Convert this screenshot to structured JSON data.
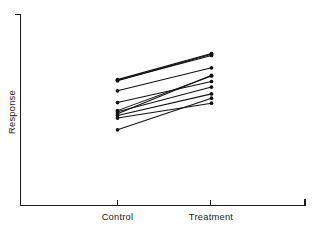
{
  "chart_data": {
    "type": "line",
    "title": "",
    "subtitle": "",
    "xlabel": "",
    "ylabel": "Response",
    "categories": [
      "Control",
      "Treatment"
    ],
    "x": [
      0,
      1
    ],
    "xlim": [
      -0.62,
      1.0
    ],
    "ylim": [
      0,
      100
    ],
    "grid": false,
    "legend": false,
    "legend_position": "none",
    "axis_style": "L-shaped open frame, no numeric tick labels",
    "marker": "filled circle",
    "line_color": "#111111",
    "axis_color": "#1a1a1a",
    "background_color": "#ffffff",
    "series": [
      {
        "name": "Subject 1",
        "values": [
          74.5,
          95.5
        ]
      },
      {
        "name": "Subject 2",
        "values": [
          74.0,
          94.0
        ]
      },
      {
        "name": "Subject 3",
        "values": [
          73.5,
          95.0
        ]
      },
      {
        "name": "Subject 4",
        "values": [
          65.5,
          84.0
        ]
      },
      {
        "name": "Subject 5",
        "values": [
          56.0,
          73.0
        ]
      },
      {
        "name": "Subject 6",
        "values": [
          49.5,
          77.5
        ]
      },
      {
        "name": "Subject 7",
        "values": [
          48.5,
          68.5
        ]
      },
      {
        "name": "Subject 8",
        "values": [
          47.0,
          78.0
        ]
      },
      {
        "name": "Subject 9",
        "values": [
          45.5,
          63.0
        ]
      },
      {
        "name": "Subject 10",
        "values": [
          43.5,
          55.5
        ]
      },
      {
        "name": "Subject 11",
        "values": [
          34.0,
          59.5
        ]
      }
    ],
    "tick_labels": {
      "x": [
        "Control",
        "Treatment"
      ],
      "y": []
    }
  },
  "axes": {
    "y_title": "Response",
    "x_category_left": "Control",
    "x_category_right": "Treatment"
  }
}
